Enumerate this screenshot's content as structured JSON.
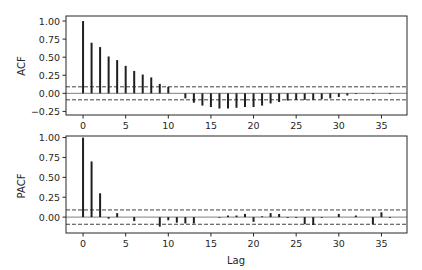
{
  "chart_data": [
    {
      "type": "bar",
      "subtype": "stem",
      "title": "",
      "xlabel": "",
      "ylabel": "ACF",
      "xlim": [
        -2,
        38
      ],
      "ylim": [
        -0.3,
        1.07
      ],
      "yticks": [
        1.0,
        0.75,
        0.5,
        0.25,
        0.0,
        -0.25
      ],
      "ytick_labels": [
        "1.00",
        "0.75",
        "0.50",
        "0.25",
        "0.00",
        "−0.25"
      ],
      "xticks": [
        0,
        5,
        10,
        15,
        20,
        25,
        30,
        35
      ],
      "xtick_labels": [
        "0",
        "5",
        "10",
        "15",
        "20",
        "25",
        "30",
        "35"
      ],
      "confidence_band": [
        -0.09,
        0.09
      ],
      "x": [
        0,
        1,
        2,
        3,
        4,
        5,
        6,
        7,
        8,
        9,
        10,
        11,
        12,
        13,
        14,
        15,
        16,
        17,
        18,
        19,
        20,
        21,
        22,
        23,
        24,
        25,
        26,
        27,
        28,
        29,
        30,
        31,
        32,
        33,
        34,
        35,
        36
      ],
      "values": [
        1.0,
        0.7,
        0.64,
        0.51,
        0.46,
        0.38,
        0.31,
        0.26,
        0.22,
        0.13,
        0.09,
        0.0,
        -0.07,
        -0.13,
        -0.17,
        -0.19,
        -0.21,
        -0.21,
        -0.2,
        -0.19,
        -0.19,
        -0.17,
        -0.14,
        -0.12,
        -0.1,
        -0.09,
        -0.09,
        -0.09,
        -0.08,
        -0.07,
        -0.05,
        -0.03,
        -0.01,
        0.0,
        -0.01,
        0.0,
        -0.01
      ],
      "grid": false
    },
    {
      "type": "bar",
      "subtype": "stem",
      "title": "",
      "xlabel": "Lag",
      "ylabel": "PACF",
      "xlim": [
        -2,
        38
      ],
      "ylim": [
        -0.2,
        1.02
      ],
      "yticks": [
        1.0,
        0.75,
        0.5,
        0.25,
        0.0
      ],
      "ytick_labels": [
        "1.00",
        "0.75",
        "0.50",
        "0.25",
        "0.00"
      ],
      "xticks": [
        0,
        5,
        10,
        15,
        20,
        25,
        30,
        35
      ],
      "xtick_labels": [
        "0",
        "5",
        "10",
        "15",
        "20",
        "25",
        "30",
        "35"
      ],
      "confidence_band": [
        -0.09,
        0.09
      ],
      "x": [
        0,
        1,
        2,
        3,
        4,
        5,
        6,
        7,
        8,
        9,
        10,
        11,
        12,
        13,
        14,
        15,
        16,
        17,
        18,
        19,
        20,
        21,
        22,
        23,
        24,
        25,
        26,
        27,
        28,
        29,
        30,
        31,
        32,
        33,
        34,
        35,
        36
      ],
      "values": [
        1.0,
        0.7,
        0.3,
        -0.02,
        0.05,
        0.0,
        -0.05,
        0.0,
        0.0,
        -0.12,
        -0.04,
        -0.07,
        -0.08,
        -0.08,
        0.0,
        0.0,
        -0.01,
        0.02,
        0.02,
        0.04,
        -0.06,
        0.01,
        0.05,
        0.04,
        -0.01,
        -0.01,
        -0.09,
        -0.1,
        -0.01,
        0.0,
        0.04,
        0.0,
        0.02,
        0.0,
        -0.09,
        0.06,
        -0.01
      ],
      "grid": false
    }
  ],
  "labels": {
    "acf_ylabel": "ACF",
    "pacf_ylabel": "PACF",
    "xlabel": "Lag"
  },
  "colors": {
    "stem": "#1f1f1f",
    "zero_line": "#808080",
    "band_line": "#404040",
    "axes": "#262626"
  }
}
